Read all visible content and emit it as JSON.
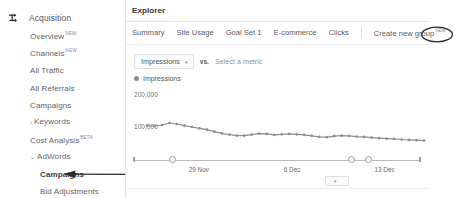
{
  "sidebar": {
    "header": {
      "label": "Acquisition",
      "icon": "acquisition-arrows-icon"
    },
    "items": [
      {
        "label": "Overview",
        "tag": "NEW",
        "caret": "",
        "sub": false,
        "bold": false,
        "top": 31
      },
      {
        "label": "Channels",
        "tag": "NEW",
        "caret": "",
        "sub": false,
        "bold": false,
        "top": 48
      },
      {
        "label": "All Traffic",
        "tag": "",
        "caret": "",
        "sub": false,
        "bold": false,
        "top": 66
      },
      {
        "label": "All Referrals",
        "tag": "",
        "caret": "",
        "sub": false,
        "bold": false,
        "top": 84
      },
      {
        "label": "Campaigns",
        "tag": "",
        "caret": "",
        "sub": false,
        "bold": false,
        "top": 101
      },
      {
        "label": "Keywords",
        "tag": "",
        "caret": "›",
        "sub": false,
        "bold": false,
        "top": 117
      },
      {
        "label": "Cost Analysis",
        "tag": "BETA",
        "caret": "",
        "sub": false,
        "bold": false,
        "top": 135
      },
      {
        "label": "AdWords",
        "tag": "",
        "caret": "⌄",
        "sub": false,
        "bold": false,
        "top": 152
      },
      {
        "label": "Campaigns",
        "tag": "",
        "caret": "",
        "sub": true,
        "bold": true,
        "top": 170
      },
      {
        "label": "Bid Adjustments",
        "tag": "",
        "caret": "",
        "sub": true,
        "bold": false,
        "top": 187
      }
    ]
  },
  "annotations": {
    "arrow_target": "Campaigns",
    "circle_target": "Clicks",
    "ink_color": "#2b2b2b"
  },
  "main": {
    "explorer_tab": "Explorer",
    "subtabs": [
      {
        "label": "Summary",
        "tag": "",
        "circled": false
      },
      {
        "label": "Site Usage",
        "tag": "",
        "circled": false
      },
      {
        "label": "Goal Set 1",
        "tag": "",
        "circled": false
      },
      {
        "label": "E-commerce",
        "tag": "",
        "circled": false
      },
      {
        "label": "Clicks",
        "tag": "",
        "circled": true
      }
    ],
    "create_group": {
      "label": "Create new group",
      "tag": "NEW"
    },
    "metric_selector": {
      "selected": "Impressions",
      "chevron": "▾",
      "vs_label": "vs.",
      "compare_placeholder": "Select a metric"
    },
    "legend": [
      {
        "label": "Impressions",
        "color": "#8d8d8d"
      }
    ],
    "date_dropdown_chevron": "▾"
  },
  "chart_data": {
    "type": "line",
    "title": "",
    "xlabel": "",
    "ylabel": "",
    "ylim": [
      0,
      200000
    ],
    "yticks": [
      100000,
      200000
    ],
    "ytick_labels": [
      "100,000",
      "200,000"
    ],
    "xtick_labels": [
      "29 Nov",
      "6 Dec",
      "13 Dec"
    ],
    "xtick_positions_pct": [
      23.5,
      56.5,
      88.0
    ],
    "grid": false,
    "legend_position": "top-left",
    "line_color": "#8d8d8d",
    "marker": "circle",
    "series": [
      {
        "name": "Impressions",
        "values": [
          104000,
          103000,
          106000,
          112000,
          109000,
          104000,
          100000,
          96000,
          92000,
          86000,
          81000,
          77000,
          74000,
          74000,
          77000,
          80000,
          79000,
          76000,
          78000,
          79000,
          78000,
          76000,
          73000,
          70000,
          69000,
          72000,
          74000,
          73000,
          71000,
          70000,
          68000,
          66000,
          65000,
          64000,
          62000,
          61000,
          60000,
          59000
        ]
      }
    ]
  }
}
